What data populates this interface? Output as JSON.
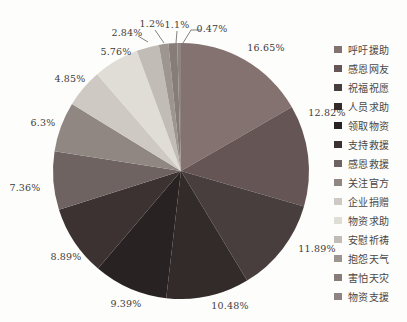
{
  "figure": {
    "background": "#fdfdfc"
  },
  "chart_data": {
    "type": "pie",
    "title": "",
    "unit": "%",
    "legend_position": "right",
    "start_angle_deg": 0,
    "direction": "clockwise",
    "slices": [
      {
        "label": "呼吁援助",
        "value": 16.65,
        "display": "16.65%",
        "color": "#847271"
      },
      {
        "label": "感恩网友",
        "value": 12.82,
        "display": "12.82%",
        "color": "#655655"
      },
      {
        "label": "祝福祝愿",
        "value": 11.89,
        "display": "11.89%",
        "color": "#483e3d"
      },
      {
        "label": "人员求助",
        "value": 10.48,
        "display": "10.48%",
        "color": "#322b2a"
      },
      {
        "label": "领取物资",
        "value": 9.39,
        "display": "9.39%",
        "color": "#282322"
      },
      {
        "label": "支持救援",
        "value": 8.89,
        "display": "8.89%",
        "color": "#3b3231"
      },
      {
        "label": "感恩救援",
        "value": 7.36,
        "display": "7.36%",
        "color": "#6e6361"
      },
      {
        "label": "关注官方",
        "value": 6.3,
        "display": "6.3%",
        "color": "#908783"
      },
      {
        "label": "企业捐赠",
        "value": 4.85,
        "display": "4.85%",
        "color": "#cec9c3"
      },
      {
        "label": "物资求助",
        "value": 5.76,
        "display": "5.76%",
        "color": "#e0ddd6"
      },
      {
        "label": "安慰祈祷",
        "value": 2.84,
        "display": "2.84%",
        "color": "#c1bcb5"
      },
      {
        "label": "抱怨天气",
        "value": 1.2,
        "display": "1.2%",
        "color": "#9d9590"
      },
      {
        "label": "害怕天灾",
        "value": 1.1,
        "display": "1.1%",
        "color": "#887c79"
      },
      {
        "label": "物资支援",
        "value": 0.47,
        "display": "0.47%",
        "color": "#8e8481"
      }
    ]
  }
}
